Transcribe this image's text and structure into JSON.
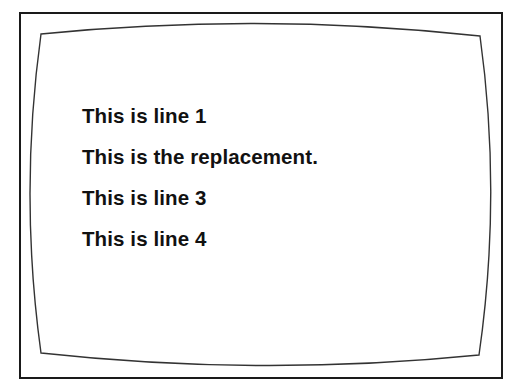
{
  "screen": {
    "lines": [
      "This is line 1",
      "This is the replacement.",
      "This is line 3",
      "This is line 4"
    ]
  },
  "colors": {
    "frame": "#1a1a1a",
    "text": "#111111",
    "background": "#ffffff"
  }
}
